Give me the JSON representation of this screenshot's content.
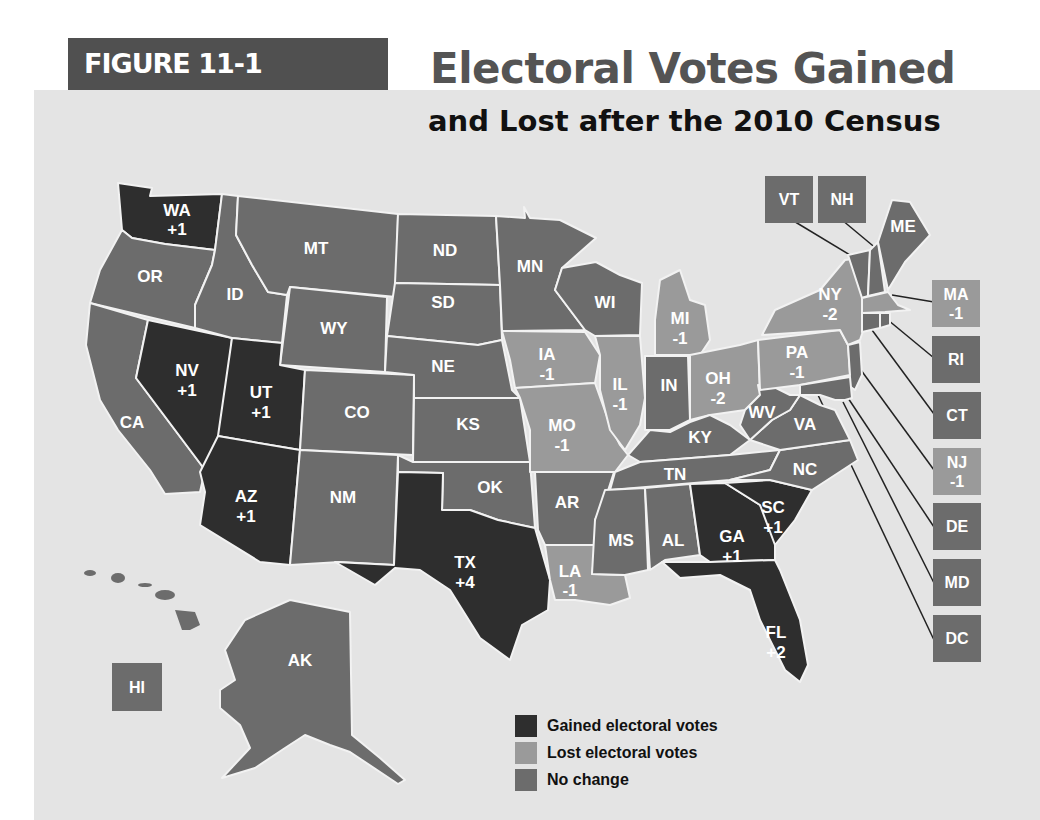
{
  "figure": {
    "tag": "FIGURE 11-1",
    "title_line1": "Electoral Votes Gained",
    "title_line2": "and Lost after the 2010 Census"
  },
  "colors": {
    "gained": "#2e2e2e",
    "lost": "#9a9a9a",
    "no_change": "#6c6c6c",
    "background": "#e4e4e4",
    "tag_background": "#505050"
  },
  "legend": {
    "items": [
      {
        "label": "Gained electoral votes",
        "color": "#2e2e2e"
      },
      {
        "label": "Lost electoral votes",
        "color": "#9a9a9a"
      },
      {
        "label": "No change",
        "color": "#6c6c6c"
      }
    ]
  },
  "states": {
    "WA": {
      "abbr": "WA",
      "change": "+1",
      "status": "gained"
    },
    "OR": {
      "abbr": "OR",
      "change": "",
      "status": "none"
    },
    "CA": {
      "abbr": "CA",
      "change": "",
      "status": "none"
    },
    "NV": {
      "abbr": "NV",
      "change": "+1",
      "status": "gained"
    },
    "ID": {
      "abbr": "ID",
      "change": "",
      "status": "none"
    },
    "MT": {
      "abbr": "MT",
      "change": "",
      "status": "none"
    },
    "WY": {
      "abbr": "WY",
      "change": "",
      "status": "none"
    },
    "UT": {
      "abbr": "UT",
      "change": "+1",
      "status": "gained"
    },
    "AZ": {
      "abbr": "AZ",
      "change": "+1",
      "status": "gained"
    },
    "CO": {
      "abbr": "CO",
      "change": "",
      "status": "none"
    },
    "NM": {
      "abbr": "NM",
      "change": "",
      "status": "none"
    },
    "ND": {
      "abbr": "ND",
      "change": "",
      "status": "none"
    },
    "SD": {
      "abbr": "SD",
      "change": "",
      "status": "none"
    },
    "NE": {
      "abbr": "NE",
      "change": "",
      "status": "none"
    },
    "KS": {
      "abbr": "KS",
      "change": "",
      "status": "none"
    },
    "OK": {
      "abbr": "OK",
      "change": "",
      "status": "none"
    },
    "TX": {
      "abbr": "TX",
      "change": "+4",
      "status": "gained"
    },
    "MN": {
      "abbr": "MN",
      "change": "",
      "status": "none"
    },
    "IA": {
      "abbr": "IA",
      "change": "-1",
      "status": "lost"
    },
    "MO": {
      "abbr": "MO",
      "change": "-1",
      "status": "lost"
    },
    "AR": {
      "abbr": "AR",
      "change": "",
      "status": "none"
    },
    "LA": {
      "abbr": "LA",
      "change": "-1",
      "status": "lost"
    },
    "WI": {
      "abbr": "WI",
      "change": "",
      "status": "none"
    },
    "IL": {
      "abbr": "IL",
      "change": "-1",
      "status": "lost"
    },
    "MI": {
      "abbr": "MI",
      "change": "-1",
      "status": "lost"
    },
    "IN": {
      "abbr": "IN",
      "change": "",
      "status": "none"
    },
    "OH": {
      "abbr": "OH",
      "change": "-2",
      "status": "lost"
    },
    "KY": {
      "abbr": "KY",
      "change": "",
      "status": "none"
    },
    "TN": {
      "abbr": "TN",
      "change": "",
      "status": "none"
    },
    "MS": {
      "abbr": "MS",
      "change": "",
      "status": "none"
    },
    "AL": {
      "abbr": "AL",
      "change": "",
      "status": "none"
    },
    "GA": {
      "abbr": "GA",
      "change": "+1",
      "status": "gained"
    },
    "FL": {
      "abbr": "FL",
      "change": "+2",
      "status": "gained"
    },
    "SC": {
      "abbr": "SC",
      "change": "+1",
      "status": "gained"
    },
    "NC": {
      "abbr": "NC",
      "change": "",
      "status": "none"
    },
    "VA": {
      "abbr": "VA",
      "change": "",
      "status": "none"
    },
    "WV": {
      "abbr": "WV",
      "change": "",
      "status": "none"
    },
    "PA": {
      "abbr": "PA",
      "change": "-1",
      "status": "lost"
    },
    "NY": {
      "abbr": "NY",
      "change": "-2",
      "status": "lost"
    },
    "ME": {
      "abbr": "ME",
      "change": "",
      "status": "none"
    },
    "AK": {
      "abbr": "AK",
      "change": "",
      "status": "none"
    },
    "HI": {
      "abbr": "HI",
      "change": "",
      "status": "none"
    },
    "VT": {
      "abbr": "VT",
      "change": "",
      "status": "none"
    },
    "NH": {
      "abbr": "NH",
      "change": "",
      "status": "none"
    },
    "MA": {
      "abbr": "MA",
      "change": "-1",
      "status": "lost"
    },
    "RI": {
      "abbr": "RI",
      "change": "",
      "status": "none"
    },
    "CT": {
      "abbr": "CT",
      "change": "",
      "status": "none"
    },
    "NJ": {
      "abbr": "NJ",
      "change": "-1",
      "status": "lost"
    },
    "DE": {
      "abbr": "DE",
      "change": "",
      "status": "none"
    },
    "MD": {
      "abbr": "MD",
      "change": "",
      "status": "none"
    },
    "DC": {
      "abbr": "DC",
      "change": "",
      "status": "none"
    }
  }
}
